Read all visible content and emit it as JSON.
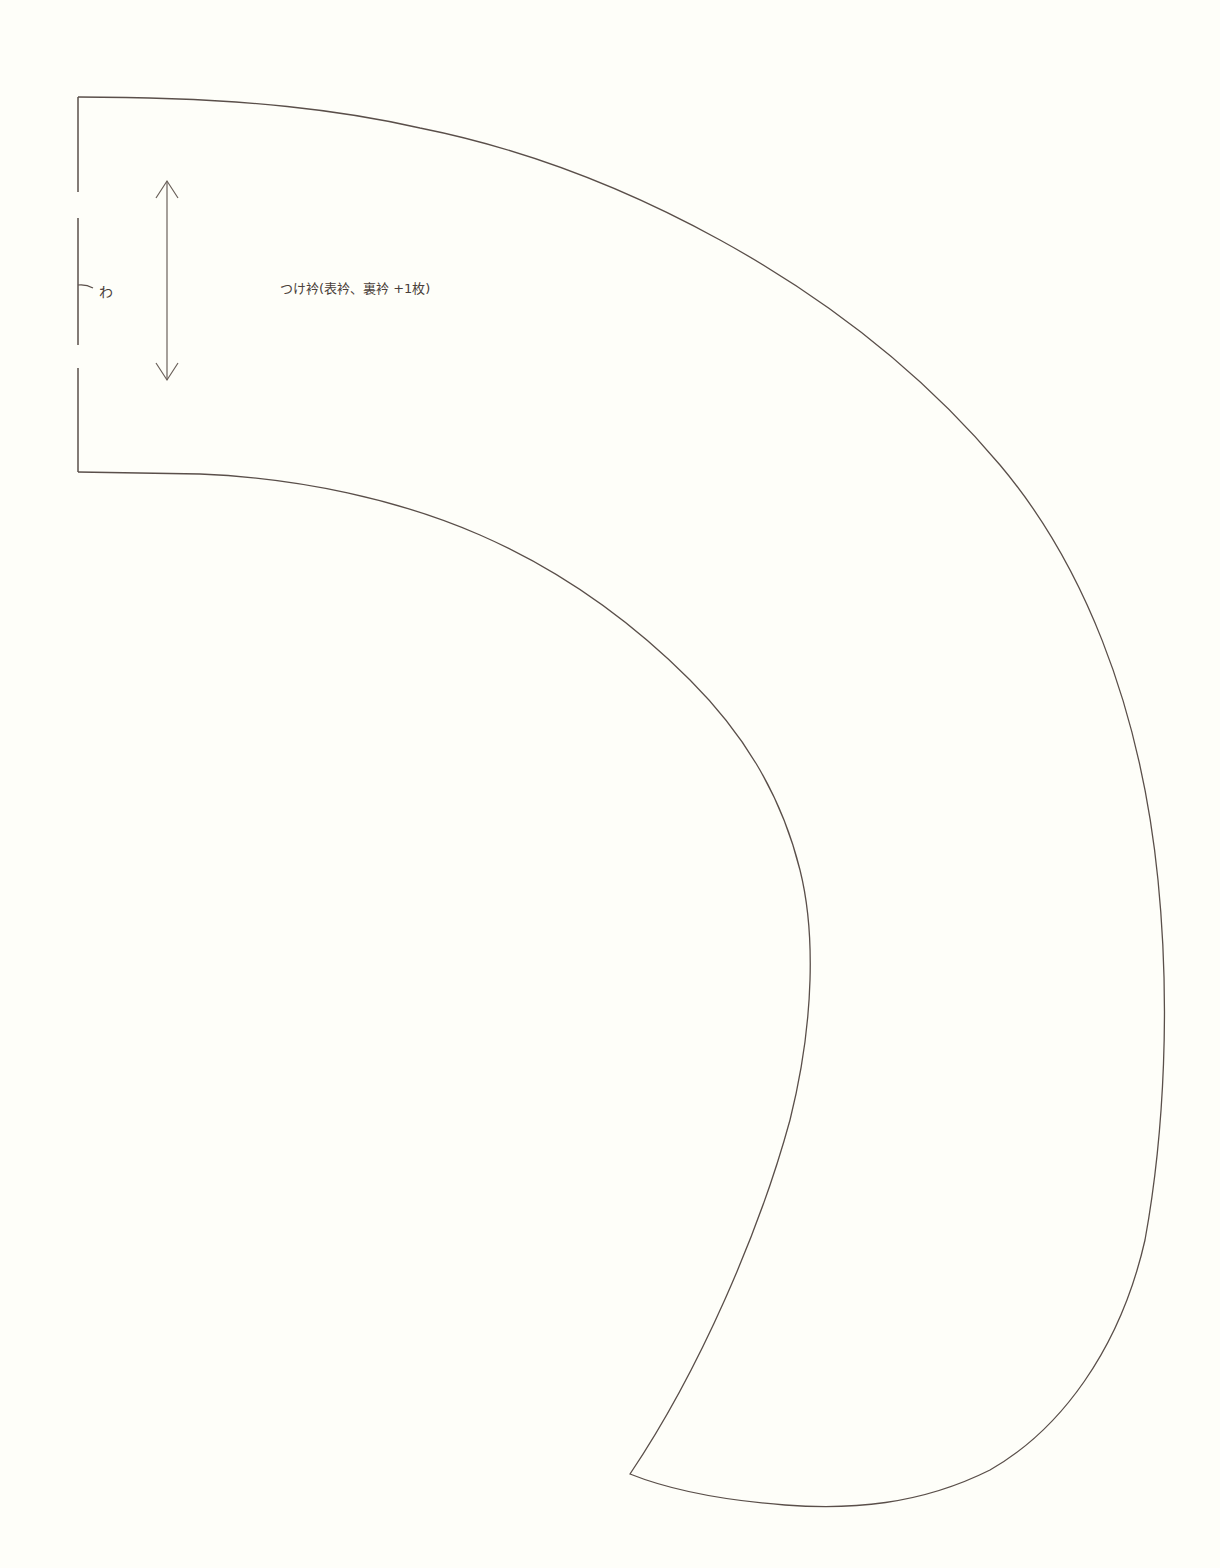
{
  "pattern": {
    "piece_label": "つけ衿(表衿、裏衿 +1枚)",
    "fold_mark": "わ",
    "line_color": "#5a4f4a",
    "background": "#fefef9"
  }
}
